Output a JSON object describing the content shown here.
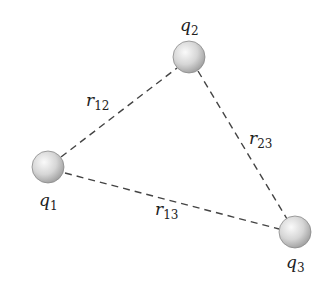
{
  "diagram": {
    "title": "",
    "charges": [
      {
        "id": "q1",
        "symbol": "q",
        "subscript": "1",
        "cx": 48,
        "cy": 167,
        "r": 16
      },
      {
        "id": "q2",
        "symbol": "q",
        "subscript": "2",
        "cx": 189,
        "cy": 57,
        "r": 16
      },
      {
        "id": "q3",
        "symbol": "q",
        "subscript": "3",
        "cx": 295,
        "cy": 232,
        "r": 16
      }
    ],
    "distances": [
      {
        "id": "r12",
        "symbol": "r",
        "subscript": "12",
        "from": "q1",
        "to": "q2"
      },
      {
        "id": "r23",
        "symbol": "r",
        "subscript": "23",
        "from": "q2",
        "to": "q3"
      },
      {
        "id": "r13",
        "symbol": "r",
        "subscript": "13",
        "from": "q1",
        "to": "q3"
      }
    ],
    "colors": {
      "line": "#444444",
      "sphere_light": "#f4f4f4",
      "sphere_dark": "#a8a8a8",
      "sphere_edge": "#8a8a8a",
      "text": "#222222"
    }
  }
}
